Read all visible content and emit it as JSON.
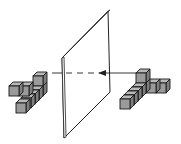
{
  "diagram": {
    "colors": {
      "cube_front": "#9a9a9a",
      "cube_top": "#b8b8b8",
      "cube_side": "#7e7e7e",
      "edge": "#1a1a1a",
      "mirror_fill": "#ffffff",
      "mirror_edge": "#222222",
      "background": "#ffffff"
    },
    "mirror": {
      "label": "",
      "corners": [
        [
          62,
          58
        ],
        [
          108,
          11
        ],
        [
          110,
          92
        ],
        [
          64,
          138
        ]
      ]
    },
    "sight_line": {
      "solid_from": [
        135,
        73
      ],
      "arrow_at": [
        104,
        73
      ],
      "dashed_to": [
        52,
        73
      ]
    },
    "objects": [
      {
        "name": "original-object",
        "side": "right",
        "cube_count": 7
      },
      {
        "name": "mirror-image",
        "side": "left",
        "cube_count": 7
      }
    ]
  }
}
